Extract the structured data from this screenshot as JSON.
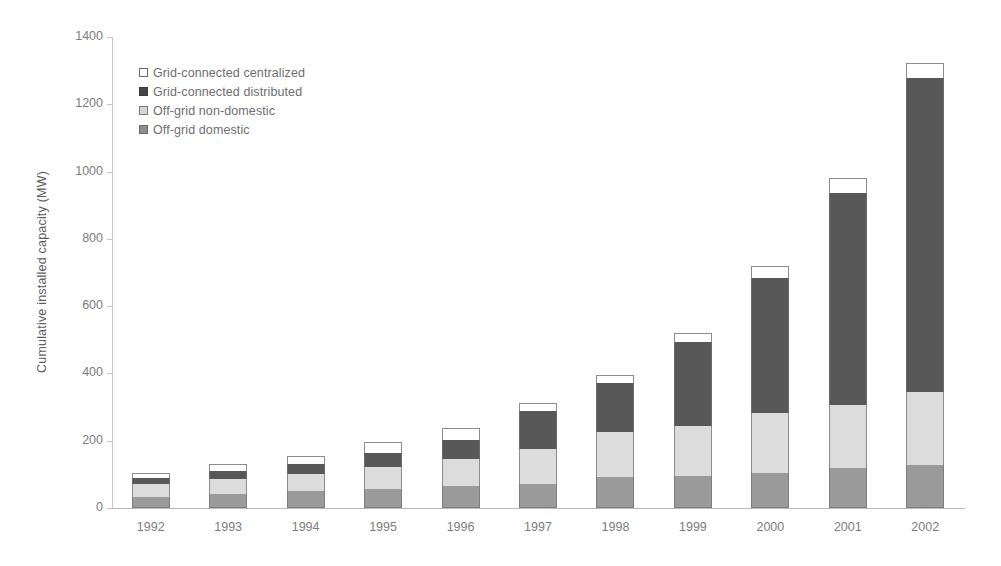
{
  "chart_data": {
    "type": "bar",
    "subtype": "stacked-vertical",
    "title": "",
    "xlabel": "",
    "ylabel": "Cumulative installed capacity (MW)",
    "ylim": [
      0,
      1400
    ],
    "ytick_step": 200,
    "ytick_labels": [
      "1400",
      "1200",
      "1000",
      "800",
      "600",
      "400",
      "200",
      "0"
    ],
    "ytick_values": [
      1400,
      1200,
      1000,
      800,
      600,
      400,
      200,
      0
    ],
    "grid": false,
    "legend_position": "top-left",
    "categories": [
      "1992",
      "1993",
      "1994",
      "1995",
      "1996",
      "1997",
      "1998",
      "1999",
      "2000",
      "2001",
      "2002"
    ],
    "stack_order_bottom_to_top": [
      "Off-grid domestic",
      "Off-grid non-domestic",
      "Grid-connected distributed",
      "Grid-connected centralized"
    ],
    "series": [
      {
        "name": "Off-grid domestic",
        "key": "domestic",
        "color": "#9a9a9a",
        "values": [
          33,
          43,
          52,
          58,
          65,
          72,
          92,
          95,
          104,
          119,
          128
        ]
      },
      {
        "name": "Off-grid non-domestic",
        "key": "nondomestic",
        "color": "#dcdcdc",
        "values": [
          38,
          42,
          48,
          63,
          80,
          103,
          134,
          149,
          179,
          187,
          217
        ]
      },
      {
        "name": "Grid-connected distributed",
        "key": "distributed",
        "color": "#585858",
        "values": [
          17,
          25,
          30,
          42,
          57,
          112,
          146,
          249,
          401,
          631,
          932
        ]
      },
      {
        "name": "Grid-connected centralized",
        "key": "centralized",
        "color": "#ffffff",
        "values": [
          16,
          20,
          25,
          32,
          35,
          25,
          23,
          27,
          36,
          44,
          45
        ]
      }
    ],
    "totals": [
      104,
      130,
      155,
      195,
      237,
      312,
      395,
      520,
      720,
      981,
      1322
    ]
  },
  "legend": {
    "items": [
      {
        "label": "Grid-connected centralized",
        "swatch": "centralized"
      },
      {
        "label": "Grid-connected distributed",
        "swatch": "distributed"
      },
      {
        "label": "Off-grid non-domestic",
        "swatch": "nondomestic"
      },
      {
        "label": "Off-grid domestic",
        "swatch": "domestic"
      }
    ]
  }
}
